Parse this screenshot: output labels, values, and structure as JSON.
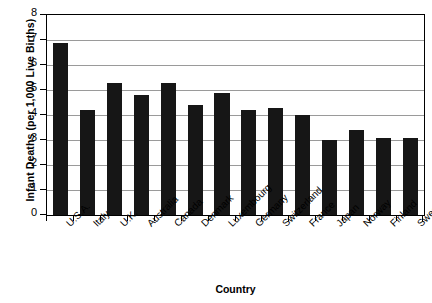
{
  "chart_data": {
    "type": "bar",
    "title": "",
    "xlabel": "Country",
    "ylabel": "Infant Deaths (per 1,000 Live Births)",
    "ylim": [
      0,
      8
    ],
    "ytick_labels": [
      "8",
      "7",
      "6",
      "5",
      "4",
      "3",
      "2",
      "1",
      "0"
    ],
    "yticks": [
      8,
      7,
      6,
      5,
      4,
      3,
      2,
      1,
      0
    ],
    "grid": true,
    "legend": "none",
    "categories": [
      "U.S.A.",
      "Italy",
      "U.K.",
      "Australia",
      "Canada",
      "Denmark",
      "Luxembourg",
      "Germany",
      "Switzerland",
      "France",
      "Japan",
      "Norway",
      "Finland",
      "Sweden"
    ],
    "values": [
      6.9,
      4.2,
      5.3,
      4.8,
      5.3,
      4.4,
      4.9,
      4.2,
      4.3,
      4.0,
      3.0,
      3.4,
      3.1,
      3.1
    ],
    "bar_color": "#161616",
    "gridline_color": "#9a9a9a",
    "axis_color": "#000000"
  }
}
